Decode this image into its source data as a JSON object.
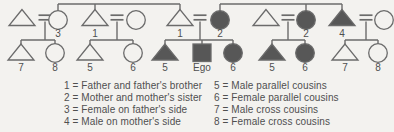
{
  "figure_type": "kinship-diagram",
  "colors": {
    "background": "#f3f2ef",
    "line": "#6b6b6b",
    "fill": "#575757",
    "text": "#4f4f4f"
  },
  "diagram": {
    "persons": [
      {
        "id": "p1",
        "shape": "triangle",
        "filled": false,
        "gen": 1,
        "x": 22,
        "label": ""
      },
      {
        "id": "p2",
        "shape": "circle",
        "filled": false,
        "gen": 1,
        "x": 58,
        "label": "3"
      },
      {
        "id": "p3",
        "shape": "triangle",
        "filled": false,
        "gen": 1,
        "x": 95,
        "label": "1"
      },
      {
        "id": "p4",
        "shape": "circle",
        "filled": false,
        "gen": 1,
        "x": 136,
        "label": ""
      },
      {
        "id": "p5",
        "shape": "triangle",
        "filled": false,
        "gen": 1,
        "x": 180,
        "label": "1"
      },
      {
        "id": "p6",
        "shape": "circle",
        "filled": true,
        "gen": 1,
        "x": 220,
        "label": "2"
      },
      {
        "id": "p7",
        "shape": "triangle",
        "filled": false,
        "gen": 1,
        "x": 266,
        "label": ""
      },
      {
        "id": "p8",
        "shape": "circle",
        "filled": true,
        "gen": 1,
        "x": 306,
        "label": "2"
      },
      {
        "id": "p9",
        "shape": "triangle",
        "filled": true,
        "gen": 1,
        "x": 342,
        "label": "4"
      },
      {
        "id": "p10",
        "shape": "circle",
        "filled": false,
        "gen": 1,
        "x": 384,
        "label": ""
      },
      {
        "id": "c1",
        "shape": "triangle",
        "filled": false,
        "gen": 2,
        "x": 21,
        "label": "7"
      },
      {
        "id": "c2",
        "shape": "circle",
        "filled": false,
        "gen": 2,
        "x": 55,
        "label": "8"
      },
      {
        "id": "c3",
        "shape": "triangle",
        "filled": false,
        "gen": 2,
        "x": 90,
        "label": "5"
      },
      {
        "id": "c4",
        "shape": "circle",
        "filled": false,
        "gen": 2,
        "x": 133,
        "label": "6"
      },
      {
        "id": "c5",
        "shape": "triangle",
        "filled": true,
        "gen": 2,
        "x": 165,
        "label": "5"
      },
      {
        "id": "c6",
        "shape": "square",
        "filled": true,
        "gen": 2,
        "x": 202,
        "label": "Ego"
      },
      {
        "id": "c7",
        "shape": "circle",
        "filled": true,
        "gen": 2,
        "x": 233,
        "label": "6"
      },
      {
        "id": "c8",
        "shape": "triangle",
        "filled": true,
        "gen": 2,
        "x": 272,
        "label": "5"
      },
      {
        "id": "c9",
        "shape": "circle",
        "filled": true,
        "gen": 2,
        "x": 305,
        "label": "6"
      },
      {
        "id": "c10",
        "shape": "triangle",
        "filled": false,
        "gen": 2,
        "x": 345,
        "label": "7"
      },
      {
        "id": "c11",
        "shape": "circle",
        "filled": false,
        "gen": 2,
        "x": 378,
        "label": "8"
      }
    ],
    "marriages": [
      {
        "spouses": [
          "p1",
          "p2"
        ],
        "eq_x": 45,
        "children": [
          "c1",
          "c2"
        ]
      },
      {
        "spouses": [
          "p3",
          "p4"
        ],
        "eq_x": 117,
        "children": [
          "c3",
          "c4"
        ]
      },
      {
        "spouses": [
          "p5",
          "p6"
        ],
        "eq_x": 200,
        "children": [
          "c5",
          "c6",
          "c7"
        ]
      },
      {
        "spouses": [
          "p7",
          "p8"
        ],
        "eq_x": 288,
        "children": [
          "c8",
          "c9"
        ]
      },
      {
        "spouses": [
          "p9",
          "p10"
        ],
        "eq_x": 366,
        "children": [
          "c10",
          "c11"
        ]
      }
    ],
    "sibling_links": [
      {
        "members": [
          "p2",
          "p3",
          "p5"
        ]
      },
      {
        "members": [
          "p6",
          "p8",
          "p9"
        ]
      }
    ]
  },
  "legend": {
    "left": [
      "1 = Father and father's brother",
      "2 = Mother and mother's sister",
      "3 = Female on father's side",
      "4 = Male on mother's side"
    ],
    "right": [
      "5 = Male parallel cousins",
      "6 = Female parallel cousins",
      "7 = Male cross cousins",
      "8 = Female cross cousins"
    ]
  }
}
